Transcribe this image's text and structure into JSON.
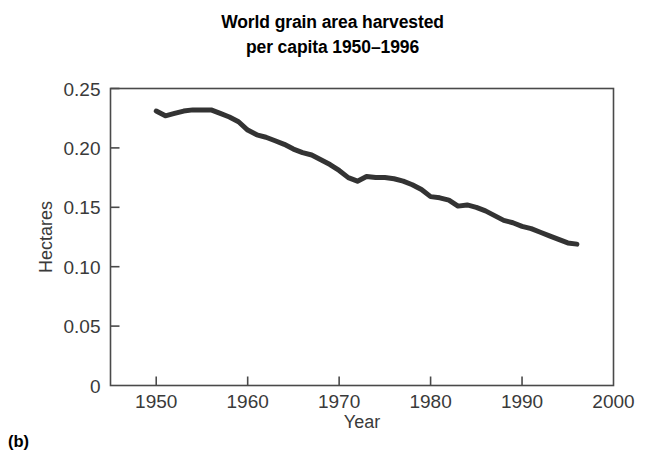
{
  "figure": {
    "panel_label": "(b)",
    "title_line1": "World grain area harvested",
    "title_line2": "per capita 1950–1996"
  },
  "chart_data": {
    "type": "line",
    "title": "World grain area harvested per capita 1950–1996",
    "xlabel": "Year",
    "ylabel": "Hectares",
    "xlim": [
      1945,
      2000
    ],
    "ylim": [
      0,
      0.25
    ],
    "xticks": [
      1950,
      1960,
      1970,
      1980,
      1990,
      2000
    ],
    "xtick_labels": [
      "1950",
      "1960",
      "1970",
      "1980",
      "1990",
      "2000"
    ],
    "yticks": [
      0,
      0.05,
      0.1,
      0.15,
      0.2,
      0.25
    ],
    "ytick_labels": [
      "0",
      "0.05",
      "0.10",
      "0.15",
      "0.20",
      "0.25"
    ],
    "grid": false,
    "legend": false,
    "line_color": "#333333",
    "line_width": 5,
    "series": [
      {
        "name": "Grain area harvested per capita",
        "x": [
          1950,
          1951,
          1952,
          1953,
          1954,
          1955,
          1956,
          1957,
          1958,
          1959,
          1960,
          1961,
          1962,
          1963,
          1964,
          1965,
          1966,
          1967,
          1968,
          1969,
          1970,
          1971,
          1972,
          1973,
          1974,
          1975,
          1976,
          1977,
          1978,
          1979,
          1980,
          1981,
          1982,
          1983,
          1984,
          1985,
          1986,
          1987,
          1988,
          1989,
          1990,
          1991,
          1992,
          1993,
          1994,
          1995,
          1996
        ],
        "y": [
          0.231,
          0.227,
          0.229,
          0.231,
          0.232,
          0.232,
          0.232,
          0.229,
          0.226,
          0.222,
          0.215,
          0.211,
          0.209,
          0.206,
          0.203,
          0.199,
          0.196,
          0.194,
          0.19,
          0.186,
          0.181,
          0.175,
          0.172,
          0.176,
          0.175,
          0.175,
          0.174,
          0.172,
          0.169,
          0.165,
          0.159,
          0.158,
          0.156,
          0.151,
          0.152,
          0.15,
          0.147,
          0.143,
          0.139,
          0.137,
          0.134,
          0.132,
          0.129,
          0.126,
          0.123,
          0.12,
          0.119
        ]
      }
    ]
  }
}
